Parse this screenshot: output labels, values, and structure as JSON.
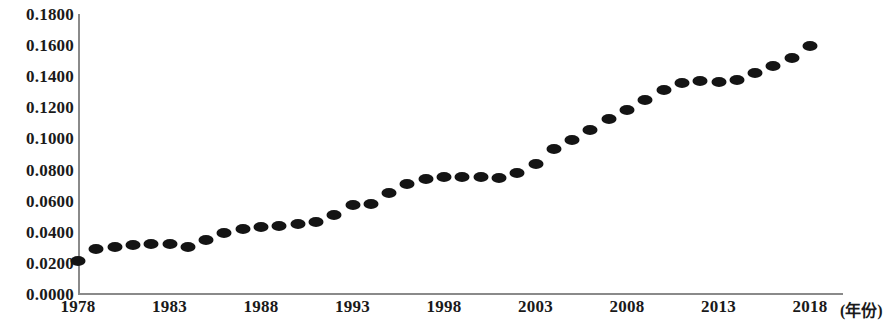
{
  "chart_data": {
    "type": "scatter",
    "title": "",
    "subtitle": "",
    "xlabel": "(年份)",
    "ylabel": "",
    "grid": false,
    "legend": null,
    "marker_color": "#141414",
    "axis_color": "#8a8a8a",
    "xlim": [
      1977,
      2019
    ],
    "ylim": [
      0.0,
      0.18
    ],
    "x_ticks": [
      "1978",
      "1983",
      "1988",
      "1993",
      "1998",
      "2003",
      "2008",
      "2013",
      "2018"
    ],
    "x_tick_values": [
      1978,
      1983,
      1988,
      1993,
      1998,
      2003,
      2008,
      2013,
      2018
    ],
    "y_ticks": [
      "0.0000",
      "0.0200",
      "0.0400",
      "0.0600",
      "0.0800",
      "0.1000",
      "0.1200",
      "0.1400",
      "0.1600",
      "0.1800"
    ],
    "y_tick_values": [
      0.0,
      0.02,
      0.04,
      0.06,
      0.08,
      0.1,
      0.12,
      0.14,
      0.16,
      0.18
    ],
    "x": [
      1978,
      1979,
      1980,
      1981,
      1982,
      1983,
      1984,
      1985,
      1986,
      1987,
      1988,
      1989,
      1990,
      1991,
      1992,
      1993,
      1994,
      1995,
      1996,
      1997,
      1998,
      1999,
      2000,
      2001,
      2002,
      2003,
      2004,
      2005,
      2006,
      2007,
      2008,
      2009,
      2010,
      2011,
      2012,
      2013,
      2014,
      2015,
      2016,
      2017,
      2018
    ],
    "values": [
      0.021,
      0.029,
      0.0305,
      0.0315,
      0.032,
      0.032,
      0.0305,
      0.035,
      0.039,
      0.0415,
      0.043,
      0.044,
      0.045,
      0.0465,
      0.0505,
      0.057,
      0.058,
      0.065,
      0.071,
      0.074,
      0.075,
      0.0755,
      0.0755,
      0.0745,
      0.0775,
      0.0835,
      0.093,
      0.099,
      0.1055,
      0.1125,
      0.1185,
      0.1245,
      0.131,
      0.1355,
      0.137,
      0.1365,
      0.1375,
      0.142,
      0.1465,
      0.152,
      0.1595
    ],
    "series_name": ""
  }
}
